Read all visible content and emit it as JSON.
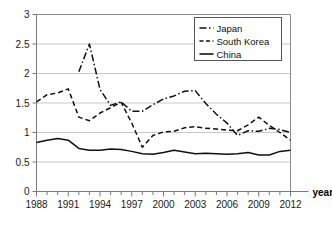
{
  "chart_data": {
    "type": "line",
    "title": "",
    "xlabel": "year",
    "ylabel": "",
    "xlim": [
      1988,
      2012
    ],
    "ylim": [
      0,
      3
    ],
    "yticks": [
      "0",
      "0.5",
      "1",
      "1.5",
      "2",
      "2.5",
      "3"
    ],
    "ytick_values": [
      0,
      0.5,
      1,
      1.5,
      2,
      2.5,
      3
    ],
    "xticks": [
      "1988",
      "1991",
      "1994",
      "1997",
      "2000",
      "2003",
      "2006",
      "2009",
      "2012"
    ],
    "xtick_values": [
      1988,
      1991,
      1994,
      1997,
      2000,
      2003,
      2006,
      2009,
      2012
    ],
    "x": [
      1988,
      1989,
      1990,
      1991,
      1992,
      1993,
      1994,
      1995,
      1996,
      1997,
      1998,
      1999,
      2000,
      2001,
      2002,
      2003,
      2004,
      2005,
      2006,
      2007,
      2008,
      2009,
      2010,
      2011,
      2012
    ],
    "grid": true,
    "grid_axis": "y",
    "legend_position": "top-right",
    "series": [
      {
        "name": "Japan",
        "style": "dash-dot",
        "color": "#111111",
        "x": [
          1992,
          1993,
          1994,
          1995,
          1996,
          1997,
          1998,
          1999,
          2000,
          2001,
          2002,
          2003,
          2004,
          2005,
          2006,
          2007,
          2008,
          2009,
          2010,
          2011,
          2012
        ],
        "values": [
          2.03,
          2.5,
          1.73,
          1.46,
          1.52,
          1.36,
          1.36,
          1.47,
          1.57,
          1.62,
          1.7,
          1.71,
          1.49,
          1.31,
          1.16,
          0.95,
          1.03,
          1.02,
          1.07,
          1.05,
          1.0
        ]
      },
      {
        "name": "South Korea",
        "style": "dashed",
        "color": "#111111",
        "x": [
          1988,
          1989,
          1990,
          1991,
          1992,
          1993,
          1994,
          1995,
          1996,
          1997,
          1998,
          1999,
          2000,
          2001,
          2002,
          2003,
          2004,
          2005,
          2006,
          2007,
          2008,
          2009,
          2010,
          2011,
          2012
        ],
        "values": [
          1.52,
          1.64,
          1.67,
          1.74,
          1.26,
          1.2,
          1.33,
          1.42,
          1.51,
          1.16,
          0.75,
          0.95,
          1.01,
          1.02,
          1.08,
          1.1,
          1.07,
          1.06,
          1.04,
          1.03,
          1.13,
          1.26,
          1.12,
          1.0,
          0.87
        ]
      },
      {
        "name": "China",
        "style": "solid",
        "color": "#111111",
        "x": [
          1988,
          1989,
          1990,
          1991,
          1992,
          1993,
          1994,
          1995,
          1996,
          1997,
          1998,
          1999,
          2000,
          2001,
          2002,
          2003,
          2004,
          2005,
          2006,
          2007,
          2008,
          2009,
          2010,
          2011,
          2012
        ],
        "values": [
          0.83,
          0.87,
          0.9,
          0.87,
          0.73,
          0.7,
          0.7,
          0.72,
          0.71,
          0.68,
          0.64,
          0.63,
          0.66,
          0.7,
          0.67,
          0.64,
          0.65,
          0.64,
          0.63,
          0.64,
          0.66,
          0.62,
          0.62,
          0.68,
          0.7
        ]
      }
    ]
  },
  "legend": {
    "items": [
      {
        "label": "Japan"
      },
      {
        "label": "South Korea"
      },
      {
        "label": "China"
      }
    ]
  },
  "axis": {
    "x_title": "year"
  }
}
